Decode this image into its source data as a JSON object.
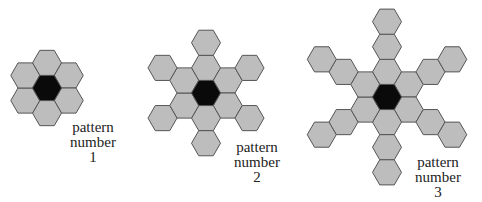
{
  "title_partial": "",
  "colors": {
    "hex_fill": "#bdbdbd",
    "hex_stroke": "#555555",
    "center_fill": "#0a0a0a"
  },
  "patterns": [
    {
      "id": 1,
      "label_line1": "pattern",
      "label_line2": "number",
      "label_number": "1",
      "center": [
        47,
        88
      ],
      "arm_length": 1
    },
    {
      "id": 2,
      "label_line1": "pattern",
      "label_line2": "number",
      "label_number": "2",
      "center": [
        206,
        93
      ],
      "arm_length": 2
    },
    {
      "id": 3,
      "label_line1": "pattern",
      "label_line2": "number",
      "label_number": "3",
      "center": [
        387,
        97
      ],
      "arm_length": 3
    }
  ],
  "hex": {
    "size": 14.5
  }
}
